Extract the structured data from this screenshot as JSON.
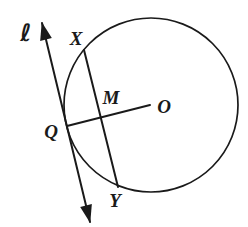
{
  "diagram": {
    "background_color": "#ffffff",
    "stroke_color": "#1a1a1a",
    "canvas": {
      "width": 248,
      "height": 227
    },
    "circle": {
      "name": "circle-o",
      "cx": 151,
      "cy": 105,
      "r": 87,
      "stroke_width": 1.7
    },
    "lines": [
      {
        "name": "tangent-line-l",
        "x1": 42,
        "y1": 23,
        "x2": 90,
        "y2": 222,
        "stroke_width": 2,
        "arrow_start": true,
        "arrow_end": true
      },
      {
        "name": "chord-x-y",
        "x1": 84,
        "y1": 50,
        "x2": 118,
        "y2": 187,
        "stroke_width": 2,
        "arrow_start": false,
        "arrow_end": false
      },
      {
        "name": "segment-q-o",
        "x1": 67,
        "y1": 126,
        "x2": 150,
        "y2": 105,
        "stroke_width": 2,
        "arrow_start": false,
        "arrow_end": false
      }
    ],
    "labels": [
      {
        "name": "label-line-l",
        "text": "ℓ",
        "x": 26,
        "y": 41,
        "font_size": 24
      },
      {
        "name": "label-point-x",
        "text": "X",
        "x": 76,
        "y": 45,
        "font_size": 19
      },
      {
        "name": "label-point-m",
        "text": "M",
        "x": 111,
        "y": 104,
        "font_size": 19
      },
      {
        "name": "label-point-o",
        "text": "O",
        "x": 164,
        "y": 113,
        "font_size": 19
      },
      {
        "name": "label-point-q",
        "text": "Q",
        "x": 51,
        "y": 138,
        "font_size": 19
      },
      {
        "name": "label-point-y",
        "text": "Y",
        "x": 115,
        "y": 207,
        "font_size": 19
      }
    ],
    "arrowhead": {
      "path": "M1,1 L19,7 L1,13 Z",
      "width": 20,
      "height": 14,
      "ref_x": 18,
      "ref_y": 7
    }
  }
}
